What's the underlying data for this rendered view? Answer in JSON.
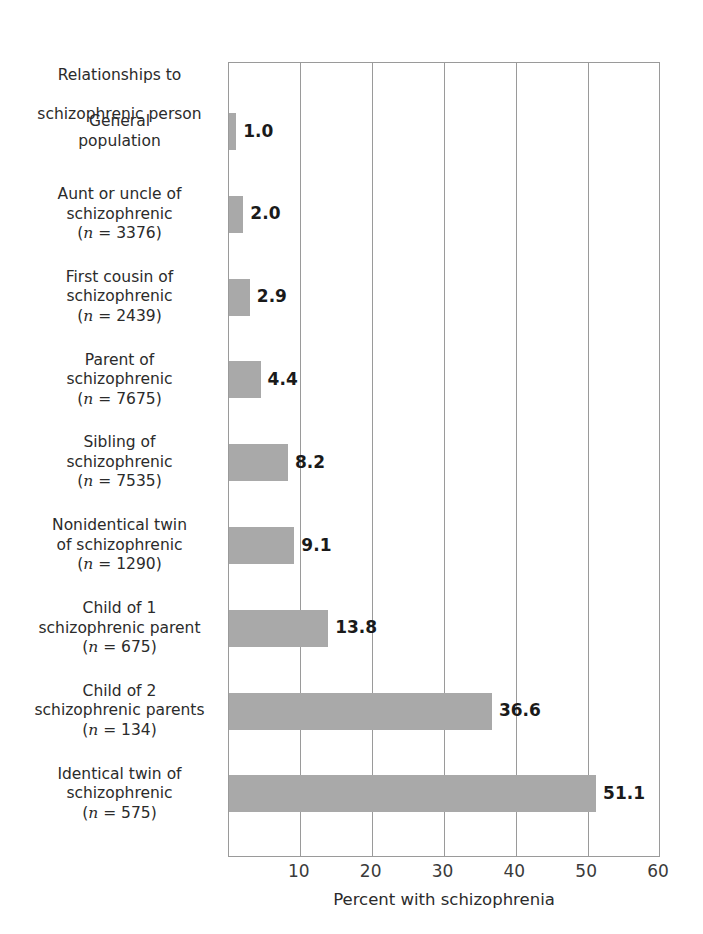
{
  "page": {
    "top_remnant_text": "Schizophrenia"
  },
  "chart_data": {
    "type": "bar",
    "orientation": "horizontal",
    "title": "",
    "xlabel": "Percent with schizophrenia",
    "ylabel": "Relationships to\nschizophrenic person",
    "xlim": [
      0,
      60
    ],
    "xticks": [
      10,
      20,
      30,
      40,
      50,
      60
    ],
    "grid": "vertical",
    "legend": "none",
    "bar_color": "#a9a9a9",
    "axis_color": "#9a9a9a",
    "categories": [
      "General\npopulation",
      "Aunt or uncle of\nschizophrenic\n(n = 3376)",
      "First cousin of\nschizophrenic\n(n = 2439)",
      "Parent of\nschizophrenic\n(n = 7675)",
      "Sibling of\nschizophrenic\n(n = 7535)",
      "Nonidentical twin\nof schizophrenic\n(n = 1290)",
      "Child of 1\nschizophrenic parent\n(n = 675)",
      "Child of 2\nschizophrenic parents\n(n = 134)",
      "Identical twin of\nschizophrenic\n(n = 575)"
    ],
    "values": [
      1.0,
      2.0,
      2.9,
      4.4,
      8.2,
      9.1,
      13.8,
      36.6,
      51.1
    ],
    "value_labels": [
      "1.0",
      "2.0",
      "2.9",
      "4.4",
      "8.2",
      "9.1",
      "13.8",
      "36.6",
      "51.1"
    ],
    "sample_sizes": [
      null,
      3376,
      2439,
      7675,
      7535,
      1290,
      675,
      134,
      575
    ],
    "rows": [
      {
        "line1": "General",
        "line2": "population",
        "line3": "",
        "value": 1.0,
        "label": "1.0"
      },
      {
        "line1": "Aunt or uncle of",
        "line2": "schizophrenic",
        "line3": " = 3376)",
        "value": 2.0,
        "label": "2.0"
      },
      {
        "line1": "First cousin of",
        "line2": "schizophrenic",
        "line3": " = 2439)",
        "value": 2.9,
        "label": "2.9"
      },
      {
        "line1": "Parent of",
        "line2": "schizophrenic",
        "line3": " = 7675)",
        "value": 4.4,
        "label": "4.4"
      },
      {
        "line1": "Sibling of",
        "line2": "schizophrenic",
        "line3": " = 7535)",
        "value": 8.2,
        "label": "8.2"
      },
      {
        "line1": "Nonidentical twin",
        "line2": "of schizophrenic",
        "line3": " = 1290)",
        "value": 9.1,
        "label": "9.1"
      },
      {
        "line1": "Child of 1",
        "line2": "schizophrenic parent",
        "line3": " = 675)",
        "value": 13.8,
        "label": "13.8"
      },
      {
        "line1": "Child of 2",
        "line2": "schizophrenic parents",
        "line3": " = 134)",
        "value": 36.6,
        "label": "36.6"
      },
      {
        "line1": "Identical twin of",
        "line2": "schizophrenic",
        "line3": " = 575)",
        "value": 51.1,
        "label": "51.1"
      }
    ],
    "axis_header_line1": "Relationships to",
    "axis_header_line2": "schizophrenic person"
  }
}
